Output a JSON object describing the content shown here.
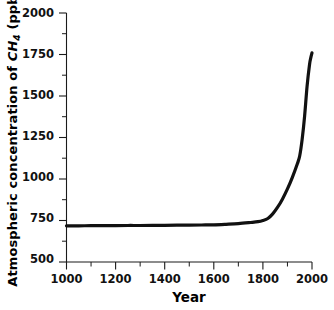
{
  "chart_data": {
    "type": "line",
    "title": "",
    "xlabel": "Year",
    "ylabel": "Atmospheric concentration of CH4 (ppb)",
    "ylabel_parts": {
      "prefix": "Atmospheric concentration of ",
      "species": "CH",
      "species_sub": "4",
      "units": " (ppb)"
    },
    "xlim": [
      1000,
      2000
    ],
    "ylim": [
      500,
      2000
    ],
    "xticks": [
      1000,
      1200,
      1400,
      1600,
      1800,
      2000
    ],
    "xticklabels": [
      "1000",
      "1200",
      "1400",
      "1600",
      "1800",
      "2000"
    ],
    "yticks": [
      500,
      750,
      1000,
      1250,
      1500,
      1750,
      2000
    ],
    "yticklabels": [
      "500",
      "750",
      "1000",
      "1250",
      "1500",
      "1750",
      "2000"
    ],
    "xminor_step": 100,
    "yminor_step": 125,
    "grid": false,
    "legend": null,
    "spines": [
      "left",
      "bottom"
    ],
    "tick_direction": "out",
    "series": [
      {
        "name": "CH4 concentration",
        "color": "#111111",
        "linewidth": 3.2,
        "x": [
          1000,
          1050,
          1100,
          1150,
          1200,
          1250,
          1300,
          1350,
          1400,
          1450,
          1500,
          1550,
          1600,
          1650,
          1700,
          1750,
          1780,
          1800,
          1820,
          1840,
          1860,
          1880,
          1900,
          1920,
          1940,
          1950,
          1960,
          1970,
          1980,
          1990,
          1995,
          2000
        ],
        "y": [
          718,
          718,
          719,
          719,
          719,
          720,
          720,
          721,
          721,
          722,
          722,
          723,
          724,
          727,
          731,
          738,
          743,
          750,
          762,
          790,
          830,
          880,
          940,
          1010,
          1090,
          1140,
          1240,
          1380,
          1560,
          1690,
          1730,
          1760
        ]
      }
    ]
  }
}
